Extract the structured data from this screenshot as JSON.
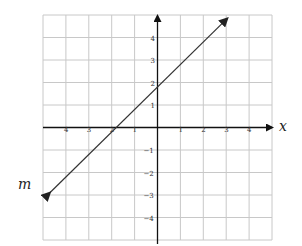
{
  "graph": {
    "x_axis_label": "x",
    "line_label": "m",
    "x_ticks": [
      {
        "value": -4,
        "label": "-4"
      },
      {
        "value": -3,
        "label": "-3"
      },
      {
        "value": -2,
        "label": "-2"
      },
      {
        "value": -1,
        "label": "-1"
      },
      {
        "value": 1,
        "label": "1"
      },
      {
        "value": 2,
        "label": "2"
      },
      {
        "value": 3,
        "label": "3"
      },
      {
        "value": 4,
        "label": "4"
      }
    ],
    "y_ticks": [
      {
        "value": 4,
        "label": "4"
      },
      {
        "value": 3,
        "label": "3"
      },
      {
        "value": 2,
        "label": "2"
      },
      {
        "value": 1,
        "label": "1"
      },
      {
        "value": -1,
        "label": "−1"
      },
      {
        "value": -2,
        "label": "−2"
      },
      {
        "value": -3,
        "label": "−3"
      },
      {
        "value": -4,
        "label": "−4"
      }
    ],
    "grid": {
      "xmin": -5,
      "xmax": 5,
      "ymin": -5,
      "ymax": 5
    },
    "line": {
      "slope": 1,
      "y_intercept": 1.8,
      "x_intercept": -1.8,
      "color": "#333333"
    },
    "grid_color": "#c8c8c8",
    "axis_color": "#111111"
  }
}
